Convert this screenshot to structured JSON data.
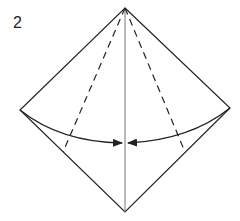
{
  "diagram": {
    "step_number": "2",
    "type": "origami-fold-step",
    "shape": "diamond",
    "vertices": {
      "top": [
        125,
        8
      ],
      "left": [
        20,
        110
      ],
      "right": [
        230,
        108
      ],
      "bottom": [
        125,
        212
      ]
    },
    "center_line": "solid vertical crease",
    "fold_lines": [
      {
        "style": "dashed",
        "from": "top",
        "to": [
          63,
          152
        ]
      },
      {
        "style": "dashed",
        "from": "top",
        "to": [
          185,
          152
        ]
      }
    ],
    "arrows": [
      {
        "from": "left-corner",
        "to": "center-line",
        "direction": "right"
      },
      {
        "from": "right-corner",
        "to": "center-line",
        "direction": "left"
      }
    ],
    "colors": {
      "line": "#222222",
      "center_line": "#777777",
      "background": "#ffffff"
    }
  }
}
